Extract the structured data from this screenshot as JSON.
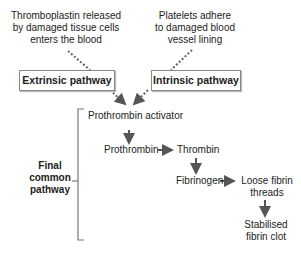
{
  "diagram": {
    "sources": {
      "extrinsic_trigger": [
        "Thromboplastin released",
        "by damaged tissue cells",
        "enters the blood"
      ],
      "intrinsic_trigger": [
        "Platelets adhere",
        "to damaged blood",
        "vessel lining"
      ]
    },
    "pathways": {
      "extrinsic": "Extrinsic pathway",
      "intrinsic": "Intrinsic pathway"
    },
    "bracket_label": [
      "Final",
      "common",
      "pathway"
    ],
    "nodes": {
      "prothrombin_activator": "Prothrombin activator",
      "prothrombin": "Prothrombin",
      "thrombin": "Thrombin",
      "fibrinogen": "Fibrinogen",
      "loose_fibrin": [
        "Loose fibrin",
        "threads"
      ],
      "stabilised_clot": [
        "Stabilised",
        "fibrin clot"
      ]
    },
    "colors": {
      "arrow": "#555555",
      "dotted": "#666666",
      "box_border": "#888888",
      "text": "#222222"
    }
  }
}
